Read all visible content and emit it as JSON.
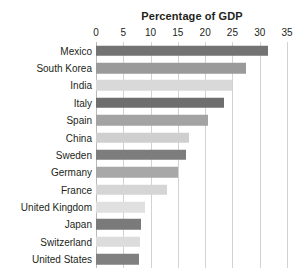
{
  "chart_data": {
    "type": "bar",
    "orientation": "horizontal",
    "title": "Percentage of GDP",
    "xlabel": "",
    "ylabel": "",
    "xlim": [
      0,
      35
    ],
    "grid": true,
    "legend": "none",
    "xticks": [
      0,
      5,
      10,
      15,
      20,
      25,
      30,
      35
    ],
    "xtick_labels": [
      "0",
      "5",
      "10",
      "15",
      "20",
      "25",
      "30",
      "35"
    ],
    "categories": [
      "Mexico",
      "South Korea",
      "India",
      "Italy",
      "Spain",
      "China",
      "Sweden",
      "Germany",
      "France",
      "United Kingdom",
      "Japan",
      "Switzerland",
      "United States"
    ],
    "values": [
      31.5,
      27.5,
      25.0,
      23.5,
      20.5,
      17.0,
      16.5,
      15.0,
      13.0,
      9.0,
      8.3,
      8.0,
      7.8
    ],
    "bar_colors": [
      "#737373",
      "#9a9a9a",
      "#d9d9d9",
      "#6e6e6e",
      "#a3a3a3",
      "#cfcfcf",
      "#7d7d7d",
      "#a8a8a8",
      "#d5d5d5",
      "#e0e0e0",
      "#7a7a7a",
      "#dcdcdc",
      "#808080"
    ]
  },
  "colors": {
    "background": "#ffffff",
    "text": "#231f20",
    "gridline": "#d2d2d2",
    "axis": "#b9b9b9"
  }
}
